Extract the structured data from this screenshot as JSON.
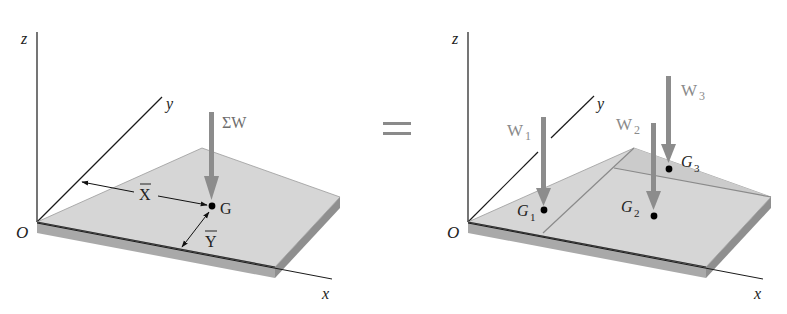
{
  "figure": {
    "equals_sign": "=",
    "colors": {
      "plate_top": "#d6d6d6",
      "plate_edge": "#a9a9a9",
      "plate_side": "#8f8f8f",
      "weight_arrow": "#8c8c8c",
      "axis_line": "#1a1a1a",
      "point": "#000000"
    },
    "left_diagram": {
      "axes": {
        "z": "z",
        "y": "y",
        "x": "x",
        "origin": "O"
      },
      "resultant_force": "ΣW",
      "center_point": "G",
      "dimension_x": "X",
      "dimension_y": "Y"
    },
    "right_diagram": {
      "axes": {
        "z": "z",
        "y": "y",
        "x": "x",
        "origin": "O"
      },
      "forces": [
        {
          "label": "W",
          "sub": "1",
          "point": "G",
          "point_sub": "1"
        },
        {
          "label": "W",
          "sub": "2",
          "point": "G",
          "point_sub": "2"
        },
        {
          "label": "W",
          "sub": "3",
          "point": "G",
          "point_sub": "3"
        }
      ]
    }
  }
}
